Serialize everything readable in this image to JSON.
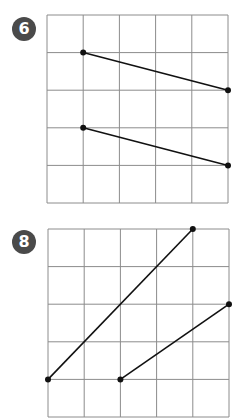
{
  "panels": [
    {
      "label": "6",
      "grid": {
        "cols": 5,
        "rows": 5
      },
      "segments": [
        {
          "from": [
            1,
            1
          ],
          "to": [
            5,
            2
          ]
        },
        {
          "from": [
            1,
            3
          ],
          "to": [
            5,
            4
          ]
        }
      ]
    },
    {
      "label": "8",
      "grid": {
        "cols": 5,
        "rows": 5
      },
      "segments": [
        {
          "from": [
            0,
            4
          ],
          "to": [
            4,
            0
          ]
        },
        {
          "from": [
            2,
            4
          ],
          "to": [
            5,
            2
          ]
        }
      ]
    }
  ],
  "colors": {
    "badge": "#4a4a4a",
    "grid_line": "#8c8c8c",
    "segment": "#111111"
  }
}
